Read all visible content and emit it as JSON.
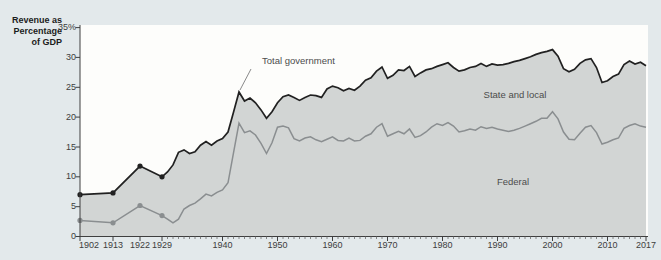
{
  "labels": {
    "y_axis_title_lines": [
      "Revenue as",
      "Percentage",
      "of GDP"
    ],
    "total_annotation": "Total government",
    "state_local_area": "State and local",
    "federal_area": "Federal"
  },
  "colors": {
    "background": "#e3e9eb",
    "plot_background": "#fdfdfb",
    "area_fill": "#d2d5d4",
    "total_line": "#212121",
    "federal_line": "#8a8e90",
    "axis": "#3f3f3f",
    "annotation_pointer": "#8a8a8a"
  },
  "chart_data": {
    "type": "area",
    "ylabel": "Revenue as Percentage of GDP",
    "ylim": [
      0,
      35
    ],
    "grid": false,
    "legend": "in-chart area labels",
    "y_ticks": [
      {
        "value": 35,
        "label": "35%"
      },
      {
        "value": 30,
        "label": "30"
      },
      {
        "value": 25,
        "label": "25"
      },
      {
        "value": 20,
        "label": "20"
      },
      {
        "value": 15,
        "label": "15"
      },
      {
        "value": 10,
        "label": "10"
      },
      {
        "value": 5,
        "label": "5"
      },
      {
        "value": 0,
        "label": "0"
      }
    ],
    "x_ticks": [
      {
        "year": 1902,
        "label": "1902"
      },
      {
        "year": 1913,
        "label": "1913"
      },
      {
        "year": 1922,
        "label": "1922"
      },
      {
        "year": 1929,
        "label": "1929"
      },
      {
        "year": 1940,
        "label": "1940"
      },
      {
        "year": 1950,
        "label": "1950"
      },
      {
        "year": 1960,
        "label": "1960"
      },
      {
        "year": 1970,
        "label": "1970"
      },
      {
        "year": 1980,
        "label": "1980"
      },
      {
        "year": 1990,
        "label": "1990"
      },
      {
        "year": 2000,
        "label": "2000"
      },
      {
        "year": 2010,
        "label": "2010"
      },
      {
        "year": 2017,
        "label": "2017"
      }
    ],
    "marker_years": [
      1902,
      1913,
      1922,
      1929
    ],
    "x_years": [
      1902,
      1913,
      1922,
      1929,
      1930,
      1931,
      1932,
      1933,
      1934,
      1935,
      1936,
      1937,
      1938,
      1939,
      1940,
      1941,
      1942,
      1943,
      1944,
      1945,
      1946,
      1947,
      1948,
      1949,
      1950,
      1951,
      1952,
      1953,
      1954,
      1955,
      1956,
      1957,
      1958,
      1959,
      1960,
      1961,
      1962,
      1963,
      1964,
      1965,
      1966,
      1967,
      1968,
      1969,
      1970,
      1971,
      1972,
      1973,
      1974,
      1975,
      1976,
      1977,
      1978,
      1979,
      1980,
      1981,
      1982,
      1983,
      1984,
      1985,
      1986,
      1987,
      1988,
      1989,
      1990,
      1991,
      1992,
      1993,
      1994,
      1995,
      1996,
      1997,
      1998,
      1999,
      2000,
      2001,
      2002,
      2003,
      2004,
      2005,
      2006,
      2007,
      2008,
      2009,
      2010,
      2011,
      2012,
      2013,
      2014,
      2015,
      2016,
      2017
    ],
    "series": [
      {
        "name": "Total government",
        "values": [
          7.0,
          7.3,
          11.8,
          10.0,
          10.8,
          12.0,
          14.1,
          14.5,
          13.9,
          14.2,
          15.3,
          15.9,
          15.3,
          16.0,
          16.4,
          17.5,
          20.8,
          24.2,
          22.7,
          23.2,
          22.4,
          21.2,
          19.8,
          20.9,
          22.4,
          23.4,
          23.7,
          23.3,
          22.8,
          23.3,
          23.7,
          23.6,
          23.3,
          24.7,
          25.2,
          24.9,
          24.4,
          24.8,
          24.5,
          25.2,
          26.2,
          26.6,
          27.7,
          28.4,
          26.5,
          27.0,
          27.9,
          27.8,
          28.5,
          26.8,
          27.4,
          27.9,
          28.1,
          28.5,
          28.8,
          29.1,
          28.3,
          27.7,
          27.9,
          28.3,
          28.5,
          29.0,
          28.5,
          28.9,
          28.7,
          28.8,
          29.0,
          29.3,
          29.5,
          29.8,
          30.1,
          30.5,
          30.8,
          31.0,
          31.3,
          30.2,
          28.1,
          27.6,
          28.0,
          29.0,
          29.6,
          29.8,
          28.3,
          25.8,
          26.1,
          26.8,
          27.2,
          28.8,
          29.4,
          28.9,
          29.2,
          28.6
        ]
      },
      {
        "name": "Federal",
        "values": [
          2.7,
          2.3,
          5.2,
          3.5,
          2.9,
          2.3,
          2.9,
          4.6,
          5.2,
          5.6,
          6.3,
          7.1,
          6.8,
          7.4,
          7.8,
          9.0,
          14.0,
          19.0,
          17.4,
          17.7,
          17.0,
          15.6,
          13.9,
          15.7,
          18.3,
          18.5,
          18.2,
          16.4,
          16.0,
          16.5,
          16.7,
          16.2,
          15.9,
          16.3,
          16.7,
          16.1,
          16.0,
          16.5,
          16.0,
          16.1,
          16.8,
          17.2,
          18.3,
          18.9,
          16.8,
          17.2,
          17.6,
          17.2,
          18.0,
          16.6,
          16.9,
          17.5,
          18.3,
          18.9,
          18.6,
          19.1,
          18.5,
          17.5,
          17.7,
          18.0,
          17.8,
          18.4,
          18.1,
          18.3,
          18.0,
          17.8,
          17.6,
          17.8,
          18.1,
          18.5,
          18.9,
          19.3,
          19.8,
          19.8,
          20.9,
          19.7,
          17.5,
          16.3,
          16.2,
          17.3,
          18.3,
          18.6,
          17.4,
          15.5,
          15.8,
          16.2,
          16.5,
          18.1,
          18.6,
          18.9,
          18.5,
          18.3
        ]
      }
    ],
    "area_labels": [
      "State and local",
      "Federal"
    ]
  }
}
